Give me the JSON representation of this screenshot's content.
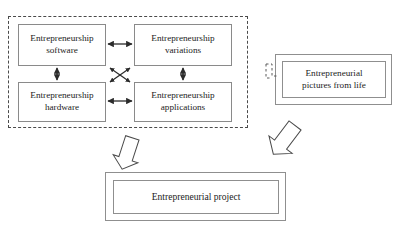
{
  "diagram": {
    "cluster": {
      "name": "entrepreneurship-components-cluster",
      "border_style": "dashed",
      "boxes": [
        {
          "id": "software",
          "label": "Entrepreneurship\nsoftware"
        },
        {
          "id": "variations",
          "label": "Entrepreneurship\nvariations"
        },
        {
          "id": "hardware",
          "label": "Entrepreneurship\nhardware"
        },
        {
          "id": "applications",
          "label": "Entrepreneurship\napplications"
        }
      ],
      "connectors": [
        {
          "id": "software-variations",
          "type": "double-arrow",
          "orientation": "horizontal"
        },
        {
          "id": "hardware-applications",
          "type": "double-arrow",
          "orientation": "horizontal"
        },
        {
          "id": "software-hardware",
          "type": "double-arrow",
          "orientation": "vertical"
        },
        {
          "id": "variations-applications",
          "type": "double-arrow",
          "orientation": "vertical"
        },
        {
          "id": "software-applications",
          "type": "double-arrow",
          "orientation": "diagonal"
        },
        {
          "id": "variations-hardware",
          "type": "double-arrow",
          "orientation": "diagonal"
        }
      ]
    },
    "pictures_box": {
      "id": "pictures-from-life",
      "label": "Entrepreneurial\npictures from life",
      "border_style": "double"
    },
    "dashed_marker": {
      "id": "dashed-connector-marker",
      "border_style": "dashed"
    },
    "project_box": {
      "id": "entrepreneurial-project",
      "label": "Entrepreneurial project",
      "border_style": "double"
    },
    "block_arrows": [
      {
        "id": "cluster-to-project",
        "direction": "down-left"
      },
      {
        "id": "pictures-to-project",
        "direction": "down-left"
      }
    ]
  },
  "colors": {
    "box_border": "#8a8a8a",
    "dashed_border": "#4a4a4a",
    "text": "#1c1c1c",
    "arrow": "#2b2b2b",
    "background": "#ffffff"
  }
}
